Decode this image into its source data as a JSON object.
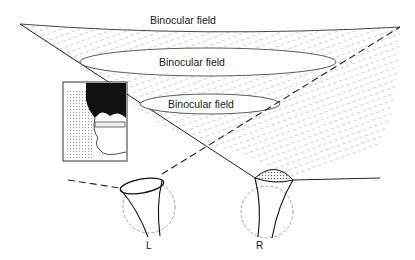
{
  "diagram": {
    "labels": {
      "field_top": "Binocular field",
      "field_middle": "Binocular field",
      "field_bottom": "Binocular field",
      "left_eye": "L",
      "right_eye": "R"
    },
    "inset": {
      "description": "profile-of-head-with-glasses"
    },
    "colors": {
      "line": "#222222",
      "hatch": "#8a8a8a",
      "background": "#ffffff"
    }
  }
}
